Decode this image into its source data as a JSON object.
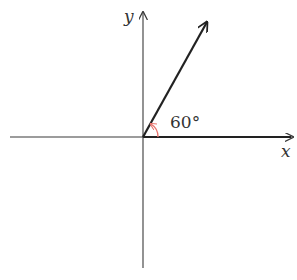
{
  "diagram": {
    "axes": {
      "x_label": "x",
      "y_label": "y",
      "origin": [
        143,
        137
      ],
      "x_axis": {
        "from": [
          10,
          137
        ],
        "to": [
          293,
          137
        ]
      },
      "y_axis": {
        "from": [
          143,
          268
        ],
        "to": [
          143,
          12
        ]
      }
    },
    "ray": {
      "angle_degrees": 60,
      "from": [
        143,
        137
      ],
      "to": [
        207,
        22
      ]
    },
    "angle_marker": {
      "label": "60°",
      "color": "#e8746e",
      "radius": 15
    },
    "colors": {
      "axis": "#3a3a3a",
      "ray": "#222222",
      "arc": "#e8746e",
      "text": "#333333"
    }
  }
}
